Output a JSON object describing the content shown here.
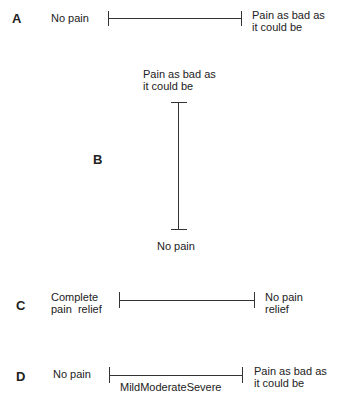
{
  "scales": [
    {
      "label": "A",
      "left": "No pain",
      "right_1": "Pain as bad as",
      "right_2": "it could be"
    },
    {
      "label": "B",
      "top_1": "Pain as bad as",
      "top_2": "it could be",
      "bottom": "No pain"
    },
    {
      "label": "C",
      "left_1": "Complete",
      "left_2": "pain  relief",
      "right_1": "No pain",
      "right_2": "relief"
    },
    {
      "label": "D",
      "left": "No pain",
      "right_1": "Pain as bad as",
      "right_2": "it could be",
      "below": "MildModerateSevere"
    }
  ]
}
